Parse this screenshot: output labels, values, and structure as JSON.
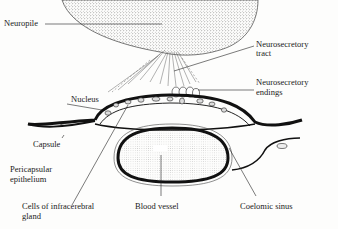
{
  "diagram": {
    "type": "anatomical-section",
    "labels": {
      "neuropile": "Neuropile",
      "neurosecretory_tract_1": "Neurosecretory",
      "neurosecretory_tract_2": "tract",
      "nucleus": "Nucleus",
      "neurosecretory_endings_1": "Neurosecretory",
      "neurosecretory_endings_2": "endings",
      "capsule": "Capsule",
      "pericapsular_1": "Pericapsular",
      "pericapsular_2": "epithelium",
      "cells_1": "Cells of infracerebral",
      "cells_2": "gland",
      "blood_vessel": "Blood vessel",
      "coelomic_sinus": "Coelomic sinus"
    },
    "colors": {
      "ink": "#1a1a1a",
      "stipple": "#555555",
      "background": "#fdfdfc"
    }
  }
}
